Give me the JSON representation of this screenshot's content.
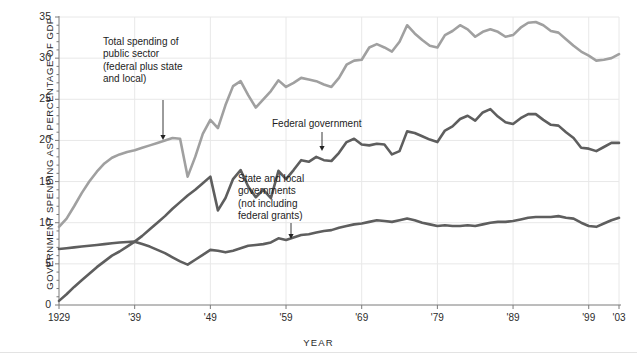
{
  "chart_data": {
    "type": "line",
    "title": "",
    "xlabel": "YEAR",
    "ylabel": "GOVERNMENT SPENDING AS A PERCENTAGE OF GDP",
    "xlim": [
      1929,
      2003
    ],
    "ylim": [
      0,
      35
    ],
    "ytick_labels": [
      "0",
      "5",
      "10",
      "15",
      "20",
      "25",
      "30",
      "35"
    ],
    "ytick_values": [
      0,
      5,
      10,
      15,
      20,
      25,
      30,
      35
    ],
    "xtick_labels": [
      "1929",
      "'39",
      "'49",
      "'59",
      "'69",
      "'79",
      "'89",
      "'99",
      "'03"
    ],
    "xtick_values": [
      1929,
      1939,
      1949,
      1959,
      1969,
      1979,
      1989,
      1999,
      2003
    ],
    "grid": true,
    "legend": "annotations",
    "colors": {
      "total": "#a0a0a0",
      "federal": "#5e5e5e",
      "state_local": "#5e5e5e",
      "axis": "#7a7a7a",
      "grid": "#e8e8e8"
    },
    "series": [
      {
        "name": "Total spending of public sector (federal plus state and local)",
        "key": "total",
        "color": "#a0a0a0",
        "x": [
          1929,
          1930,
          1931,
          1932,
          1933,
          1934,
          1935,
          1936,
          1937,
          1938,
          1939,
          1940,
          1941,
          1942,
          1943,
          1944,
          1945,
          1946,
          1947,
          1948,
          1949,
          1950,
          1951,
          1952,
          1953,
          1954,
          1955,
          1956,
          1957,
          1958,
          1959,
          1960,
          1961,
          1962,
          1963,
          1964,
          1965,
          1966,
          1967,
          1968,
          1969,
          1970,
          1971,
          1972,
          1973,
          1974,
          1975,
          1976,
          1977,
          1978,
          1979,
          1980,
          1981,
          1982,
          1983,
          1984,
          1985,
          1986,
          1987,
          1988,
          1989,
          1990,
          1991,
          1992,
          1993,
          1994,
          1995,
          1996,
          1997,
          1998,
          1999,
          2000,
          2001,
          2002,
          2003
        ],
        "y": [
          9.5,
          10.5,
          12.0,
          13.6,
          15.0,
          16.2,
          17.2,
          17.9,
          18.3,
          18.6,
          18.8,
          19.1,
          19.4,
          19.7,
          20.0,
          20.3,
          20.2,
          15.6,
          18.0,
          20.8,
          22.5,
          21.5,
          24.3,
          26.6,
          27.2,
          25.5,
          24.0,
          25.0,
          26.0,
          27.3,
          26.5,
          27.0,
          27.6,
          27.4,
          27.2,
          26.8,
          26.5,
          27.6,
          29.2,
          29.7,
          29.8,
          31.3,
          31.7,
          31.3,
          30.8,
          32.0,
          34.0,
          33.0,
          32.2,
          31.5,
          31.3,
          32.8,
          33.3,
          34.0,
          33.5,
          32.6,
          33.2,
          33.5,
          33.2,
          32.6,
          32.8,
          33.7,
          34.3,
          34.4,
          34.0,
          33.3,
          33.1,
          32.3,
          31.5,
          30.8,
          30.3,
          29.7,
          29.8,
          30.0,
          30.5
        ]
      },
      {
        "name": "Federal government",
        "key": "federal",
        "color": "#5e5e5e",
        "x": [
          1929,
          1930,
          1931,
          1932,
          1933,
          1934,
          1935,
          1936,
          1937,
          1938,
          1939,
          1940,
          1941,
          1942,
          1943,
          1944,
          1945,
          1946,
          1947,
          1948,
          1949,
          1950,
          1951,
          1952,
          1953,
          1954,
          1955,
          1956,
          1957,
          1958,
          1959,
          1960,
          1961,
          1962,
          1963,
          1964,
          1965,
          1966,
          1967,
          1968,
          1969,
          1970,
          1971,
          1972,
          1973,
          1974,
          1975,
          1976,
          1977,
          1978,
          1979,
          1980,
          1981,
          1982,
          1983,
          1984,
          1985,
          1986,
          1987,
          1988,
          1989,
          1990,
          1991,
          1992,
          1993,
          1994,
          1995,
          1996,
          1997,
          1998,
          1999,
          2000,
          2001,
          2002,
          2003
        ],
        "y": [
          0.5,
          1.3,
          2.2,
          3.0,
          3.8,
          4.6,
          5.3,
          6.0,
          6.5,
          7.1,
          7.7,
          8.4,
          9.2,
          10.0,
          10.8,
          11.7,
          12.5,
          13.3,
          14.0,
          14.8,
          15.6,
          11.5,
          13.0,
          15.3,
          16.4,
          14.4,
          13.1,
          14.0,
          13.0,
          16.3,
          15.3,
          16.4,
          17.6,
          17.4,
          18.0,
          17.6,
          17.5,
          18.5,
          19.8,
          20.2,
          19.5,
          19.4,
          19.6,
          19.5,
          18.3,
          18.7,
          21.1,
          20.9,
          20.5,
          20.1,
          19.8,
          21.2,
          21.7,
          22.6,
          23.0,
          22.4,
          23.4,
          23.8,
          22.9,
          22.2,
          22.0,
          22.7,
          23.2,
          23.2,
          22.5,
          21.9,
          21.8,
          21.0,
          20.3,
          19.1,
          19.0,
          18.7,
          19.2,
          19.7,
          19.7
        ]
      },
      {
        "name": "State and local governments (not including federal grants)",
        "key": "state_local",
        "color": "#5e5e5e",
        "x": [
          1929,
          1930,
          1931,
          1932,
          1933,
          1934,
          1935,
          1936,
          1937,
          1938,
          1939,
          1940,
          1941,
          1942,
          1943,
          1944,
          1945,
          1946,
          1947,
          1948,
          1949,
          1950,
          1951,
          1952,
          1953,
          1954,
          1955,
          1956,
          1957,
          1958,
          1959,
          1960,
          1961,
          1962,
          1963,
          1964,
          1965,
          1966,
          1967,
          1968,
          1969,
          1970,
          1971,
          1972,
          1973,
          1974,
          1975,
          1976,
          1977,
          1978,
          1979,
          1980,
          1981,
          1982,
          1983,
          1984,
          1985,
          1986,
          1987,
          1988,
          1989,
          1990,
          1991,
          1992,
          1993,
          1994,
          1995,
          1996,
          1997,
          1998,
          1999,
          2000,
          2001,
          2002,
          2003
        ],
        "y": [
          6.8,
          6.9,
          7.0,
          7.1,
          7.2,
          7.3,
          7.4,
          7.5,
          7.6,
          7.65,
          7.7,
          7.4,
          7.1,
          6.7,
          6.3,
          5.8,
          5.3,
          4.9,
          5.5,
          6.1,
          6.7,
          6.6,
          6.4,
          6.6,
          6.9,
          7.2,
          7.3,
          7.4,
          7.6,
          8.1,
          7.9,
          8.2,
          8.5,
          8.6,
          8.8,
          9.0,
          9.1,
          9.4,
          9.6,
          9.8,
          9.9,
          10.1,
          10.3,
          10.2,
          10.1,
          10.3,
          10.5,
          10.3,
          10.0,
          9.8,
          9.6,
          9.7,
          9.6,
          9.6,
          9.7,
          9.6,
          9.8,
          10.0,
          10.1,
          10.1,
          10.2,
          10.4,
          10.6,
          10.7,
          10.7,
          10.7,
          10.8,
          10.6,
          10.5,
          10.0,
          9.6,
          9.5,
          9.9,
          10.3,
          10.6
        ]
      }
    ],
    "annotations": [
      {
        "id": "total-annotation",
        "text": "Total spending of\npublic sector\n(federal plus state\nand local)",
        "x": 103,
        "y": 36,
        "arrow": {
          "x1": 163,
          "y1": 100,
          "x2": 163,
          "y2": 140
        }
      },
      {
        "id": "federal-annotation",
        "text": "Federal government",
        "x": 272,
        "y": 118,
        "arrow": {
          "x1": 322,
          "y1": 132,
          "x2": 322,
          "y2": 151
        }
      },
      {
        "id": "state-local-annotation",
        "text": "State and local\ngovernments\n(not including\nfederal grants)",
        "x": 238,
        "y": 173,
        "arrow": {
          "x1": 291,
          "y1": 223,
          "x2": 291,
          "y2": 239
        }
      }
    ]
  }
}
